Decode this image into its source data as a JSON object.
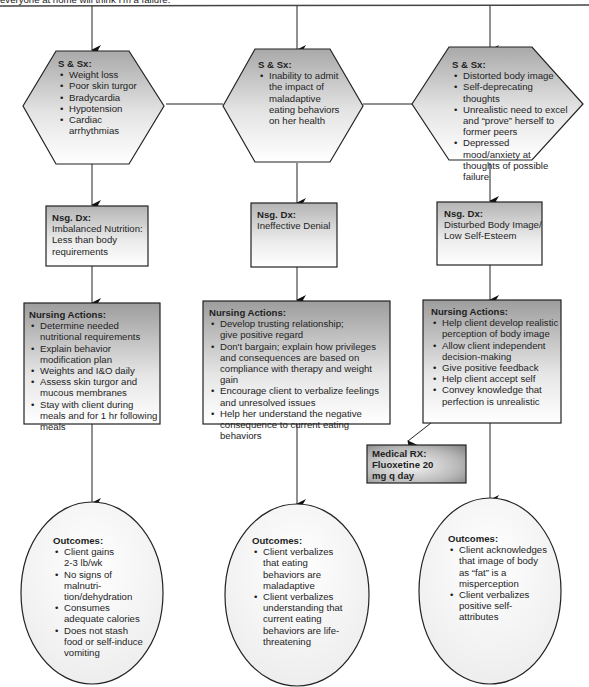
{
  "header": {
    "cut_off_text": "everyone at home will think I'm a failure."
  },
  "columns": [
    {
      "id": "nutrition",
      "signs": {
        "title": "S & Sx:",
        "items": [
          "Weight loss",
          "Poor skin turgor",
          "Bradycardia",
          "Hypotension",
          "Cardiac arrhythmias"
        ]
      },
      "diagnosis": {
        "title": "Nsg. Dx:",
        "text": "Imbalanced Nutrition: Less than body requirements"
      },
      "actions": {
        "title": "Nursing Actions:",
        "items": [
          "Determine needed nutritional requirements",
          "Explain behavior modification plan",
          "Weights and I&O daily",
          "Assess skin turgor and mucous membranes",
          "Stay with client during meals and for 1 hr following meals"
        ]
      },
      "outcomes": {
        "title": "Outcomes:",
        "items": [
          "Client gains 2-3 lb/wk",
          "No signs of malnutri-tion/dehydration",
          "Consumes adequate calories",
          "Does not stash food or self-induce vomiting"
        ]
      }
    },
    {
      "id": "denial",
      "signs": {
        "title": "S & Sx:",
        "items": [
          "Inability to admit the impact of maladaptive eating behaviors on her health"
        ]
      },
      "diagnosis": {
        "title": "Nsg. Dx:",
        "text": "Ineffective Denial"
      },
      "actions": {
        "title": "Nursing Actions:",
        "items": [
          "Develop trusting relationship; give positive regard",
          "Don't bargain; explain how privileges and consequences are based on compliance with therapy and weight gain",
          "Encourage client to verbalize feelings and unresolved issues",
          "Help her understand the negative consequence to current eating behaviors"
        ]
      },
      "outcomes": {
        "title": "Outcomes:",
        "items": [
          "Client verbalizes that eating behaviors are maladaptive",
          "Client verbalizes understanding that current eating behaviors are life-threatening"
        ]
      }
    },
    {
      "id": "body-image",
      "signs": {
        "title": "S & Sx:",
        "items": [
          "Distorted body image",
          "Self-deprecating thoughts",
          "Unrealistic need to excel and “prove” herself to former peers",
          "Depressed mood/anxiety at thoughts of possible failure"
        ]
      },
      "diagnosis": {
        "title": "Nsg. Dx:",
        "text": "Disturbed Body Image/ Low Self-Esteem"
      },
      "actions": {
        "title": "Nursing Actions:",
        "items": [
          "Help client develop realistic perception of body image",
          "Allow client independent decision-making",
          "Give positive feedback",
          "Help client accept self",
          "Convey knowledge that perfection is unrealistic"
        ]
      },
      "medical": {
        "title": "Medical RX:",
        "text": "Fluoxetine 20 mg q day"
      },
      "outcomes": {
        "title": "Outcomes:",
        "items": [
          "Client acknowledges that image of body as “fat” is a misperception",
          "Client verbalizes positive self-attributes"
        ]
      }
    }
  ]
}
